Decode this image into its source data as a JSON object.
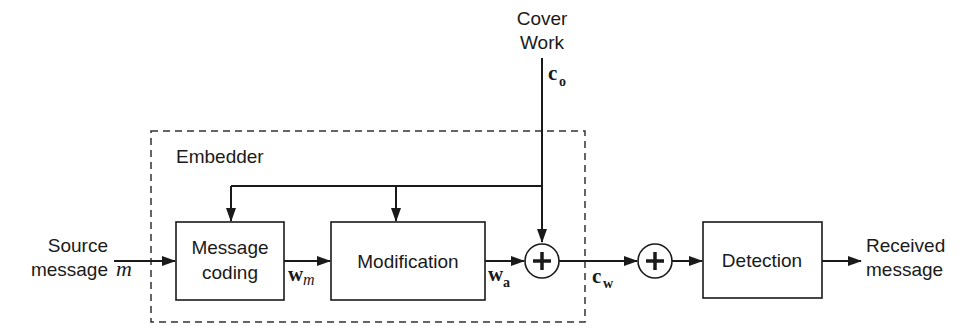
{
  "diagram": {
    "type": "block-diagram",
    "topic": "Watermark embedding and detection",
    "inputs": {
      "cover_work": {
        "line1": "Cover",
        "line2": "Work",
        "symbol": "c",
        "subscript": "o"
      },
      "source_message": {
        "line1": "Source",
        "line2": "message",
        "symbol": "m"
      }
    },
    "embedder": {
      "label": "Embedder",
      "blocks": {
        "message_coding": {
          "line1": "Message",
          "line2": "coding"
        },
        "modification": {
          "label": "Modification"
        }
      },
      "signals": {
        "wm": {
          "symbol": "w",
          "subscript": "m"
        },
        "wa": {
          "symbol": "w",
          "subscript": "a"
        }
      },
      "adder_symbol": "+"
    },
    "channel": {
      "cw": {
        "symbol": "c",
        "subscript": "w"
      },
      "noise_adder_symbol": "+"
    },
    "detector": {
      "label": "Detection"
    },
    "output": {
      "line1": "Received",
      "line2": "message"
    },
    "colors": {
      "stroke": "#1a1a1a",
      "background": "#ffffff"
    }
  }
}
